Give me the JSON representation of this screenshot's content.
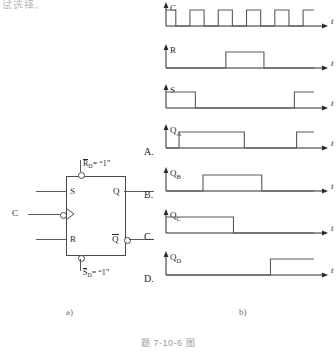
{
  "top_strip_text": "试选择。    ",
  "main_caption": "题 7-10-6 图",
  "part_a": {
    "sub_caption": "a)",
    "inputs": {
      "s_label": "S",
      "c_label": "C",
      "r_label": "R"
    },
    "outputs": {
      "q_label": "Q",
      "qbar_label": "Q"
    },
    "async_top": {
      "name": "R",
      "subscript": "D",
      "value": "= “1”"
    },
    "async_bottom": {
      "name": "S",
      "subscript": "D",
      "value": "= “1”"
    }
  },
  "part_b": {
    "sub_caption": "b)",
    "axis_label": "t",
    "waveforms": [
      {
        "choice": "",
        "signal": "C",
        "subscript": "",
        "description": "clock, five positive pulses",
        "points": [
          [
            0,
            1
          ],
          [
            9,
            1
          ],
          [
            9,
            0
          ],
          [
            22,
            0
          ],
          [
            22,
            1
          ],
          [
            35,
            1
          ],
          [
            35,
            0
          ],
          [
            48,
            0
          ],
          [
            48,
            1
          ],
          [
            61,
            1
          ],
          [
            61,
            0
          ],
          [
            74,
            0
          ],
          [
            74,
            1
          ],
          [
            87,
            1
          ],
          [
            87,
            0
          ],
          [
            100,
            0
          ],
          [
            100,
            1
          ],
          [
            113,
            1
          ],
          [
            113,
            0
          ],
          [
            126,
            0
          ],
          [
            126,
            1
          ],
          [
            136,
            1
          ]
        ]
      },
      {
        "choice": "",
        "signal": "R",
        "subscript": "",
        "description": "low, single high pulse mid-span, low",
        "points": [
          [
            0,
            0
          ],
          [
            55,
            0
          ],
          [
            55,
            1
          ],
          [
            90,
            1
          ],
          [
            90,
            0
          ],
          [
            136,
            0
          ]
        ]
      },
      {
        "choice": "",
        "signal": "S",
        "subscript": "",
        "description": "high, falls low, rises high near end",
        "points": [
          [
            0,
            1
          ],
          [
            27,
            1
          ],
          [
            27,
            0
          ],
          [
            118,
            0
          ],
          [
            118,
            1
          ],
          [
            136,
            1
          ]
        ]
      },
      {
        "choice": "A.",
        "signal": "Q",
        "subscript": "A",
        "description": "low, rises, long high, falls, rises at end",
        "points": [
          [
            0,
            0
          ],
          [
            12,
            0
          ],
          [
            12,
            1
          ],
          [
            72,
            1
          ],
          [
            72,
            0
          ],
          [
            120,
            0
          ],
          [
            120,
            1
          ],
          [
            136,
            1
          ]
        ]
      },
      {
        "choice": "B.",
        "signal": "Q",
        "subscript": "B",
        "description": "low, single high plateau, low",
        "points": [
          [
            0,
            0
          ],
          [
            34,
            0
          ],
          [
            34,
            1
          ],
          [
            88,
            1
          ],
          [
            88,
            0
          ],
          [
            136,
            0
          ]
        ]
      },
      {
        "choice": "C.",
        "signal": "Q",
        "subscript": "C",
        "description": "high, falls low partway, stays low",
        "points": [
          [
            0,
            1
          ],
          [
            62,
            1
          ],
          [
            62,
            0
          ],
          [
            136,
            0
          ]
        ]
      },
      {
        "choice": "D.",
        "signal": "Q",
        "subscript": "D",
        "description": "low, steps high near end",
        "points": [
          [
            0,
            0
          ],
          [
            96,
            0
          ],
          [
            96,
            1
          ],
          [
            136,
            1
          ]
        ]
      }
    ]
  },
  "colors": {
    "ink": "#2a2a2a",
    "line": "#5a5a5a",
    "caption": "#9a9a9a"
  }
}
